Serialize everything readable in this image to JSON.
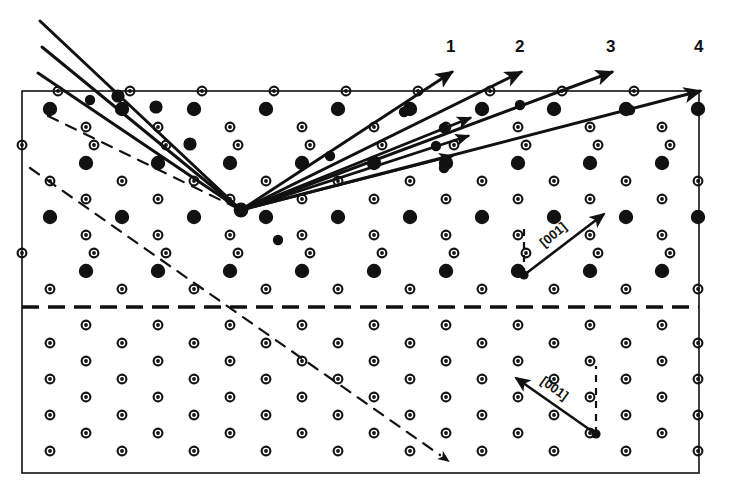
{
  "figure": {
    "kind": "crystallographic-lattice-diffraction-diagram",
    "background_color": "#ffffff",
    "ink_color": "#111111"
  },
  "frame": {
    "x": 22,
    "y": 91,
    "width": 677,
    "height": 382,
    "stroke_width": 1.6
  },
  "twin_boundary": {
    "label": "twin-boundary-dashed-line",
    "y": 307,
    "x_start": 22,
    "x_end": 699,
    "stroke_width": 3.4,
    "dash": "17 9"
  },
  "lattice": {
    "pitch_x": 72,
    "pitch_y": 36,
    "filled_radius": 7.2,
    "open_outer_radius": 4.4,
    "open_inner_radius": 1.9,
    "upper_region": {
      "note": "rows of large filled atoms alternating with rows of small open atoms, staggered",
      "rows": [
        {
          "y": 91,
          "type": "open",
          "x_start": 58,
          "count": 10
        },
        {
          "y": 109,
          "type": "filled",
          "x_start": 50,
          "count": 10
        },
        {
          "y": 127,
          "type": "open",
          "x_start": 86,
          "count": 9
        },
        {
          "y": 145,
          "type": "open",
          "x_start": 22,
          "count": 10
        },
        {
          "y": 163,
          "type": "filled",
          "x_start": 86,
          "count": 9
        },
        {
          "y": 181,
          "type": "open",
          "x_start": 50,
          "count": 10
        },
        {
          "y": 199,
          "type": "open",
          "x_start": 86,
          "count": 9
        },
        {
          "y": 217,
          "type": "filled",
          "x_start": 50,
          "count": 10
        },
        {
          "y": 235,
          "type": "open",
          "x_start": 86,
          "count": 9
        },
        {
          "y": 253,
          "type": "open",
          "x_start": 22,
          "count": 10
        },
        {
          "y": 271,
          "type": "filled",
          "x_start": 86,
          "count": 9
        },
        {
          "y": 289,
          "type": "open",
          "x_start": 50,
          "count": 10
        }
      ]
    },
    "lower_region": {
      "note": "mirrored twin: only small open atoms visible",
      "rows": [
        {
          "y": 325,
          "type": "open",
          "x_start": 86,
          "count": 9
        },
        {
          "y": 343,
          "type": "open",
          "x_start": 50,
          "count": 10
        },
        {
          "y": 361,
          "type": "open",
          "x_start": 86,
          "count": 9
        },
        {
          "y": 379,
          "type": "open",
          "x_start": 50,
          "count": 10
        },
        {
          "y": 397,
          "type": "open",
          "x_start": 86,
          "count": 9
        },
        {
          "y": 415,
          "type": "open",
          "x_start": 50,
          "count": 10
        },
        {
          "y": 433,
          "type": "open",
          "x_start": 86,
          "count": 9
        },
        {
          "y": 451,
          "type": "open",
          "x_start": 50,
          "count": 10
        }
      ]
    }
  },
  "scatter_point": {
    "x": 241,
    "y": 210,
    "label": "beam-convergence-point"
  },
  "incident_beams": [
    {
      "name": "incident-beam-a",
      "x1": 40,
      "y1": 21,
      "x2": 241,
      "y2": 210,
      "stroke_width": 3.0
    },
    {
      "name": "incident-beam-b",
      "x1": 42,
      "y1": 47,
      "x2": 241,
      "y2": 210,
      "stroke_width": 3.0
    },
    {
      "name": "incident-beam-c",
      "x1": 38,
      "y1": 73,
      "x2": 241,
      "y2": 210,
      "stroke_width": 3.0
    }
  ],
  "incident_stub_ends": [
    {
      "x": 118,
      "y": 96
    },
    {
      "x": 156,
      "y": 107
    },
    {
      "x": 190,
      "y": 144
    }
  ],
  "diffracted_beams": [
    {
      "name": "diffracted-beam-1",
      "label": "1",
      "x2": 452,
      "y2": 72,
      "label_x": 452,
      "label_y": 48,
      "stroke_width": 3.0
    },
    {
      "name": "diffracted-beam-2",
      "label": "2",
      "x2": 521,
      "y2": 72,
      "label_x": 521,
      "label_y": 48,
      "stroke_width": 3.0
    },
    {
      "name": "diffracted-beam-3",
      "label": "3",
      "x2": 612,
      "y2": 72,
      "label_x": 612,
      "label_y": 48,
      "stroke_width": 3.0
    },
    {
      "name": "diffracted-beam-4",
      "label": "4",
      "x2": 700,
      "y2": 91,
      "label_x": 700,
      "label_y": 48,
      "stroke_width": 3.0
    }
  ],
  "inner_fan_beams": [
    {
      "name": "fan-beam-inner-1",
      "x2": 470,
      "y2": 118
    },
    {
      "name": "fan-beam-inner-2",
      "x2": 468,
      "y2": 136
    },
    {
      "name": "fan-beam-inner-3",
      "x2": 452,
      "y2": 156
    }
  ],
  "beam_tick_markers": [
    {
      "x": 330,
      "y": 156
    },
    {
      "x": 404,
      "y": 112
    },
    {
      "x": 520,
      "y": 105
    },
    {
      "x": 444,
      "y": 128
    },
    {
      "x": 436,
      "y": 146
    },
    {
      "x": 444,
      "y": 168
    },
    {
      "x": 630,
      "y": 110
    },
    {
      "x": 278,
      "y": 240
    },
    {
      "x": 90,
      "y": 100
    }
  ],
  "dashed_twin_traces": [
    {
      "name": "dashed-trace-upper",
      "x1": 48,
      "y1": 116,
      "x2": 241,
      "y2": 210,
      "dash": "11 9",
      "stroke_width": 2.2
    },
    {
      "name": "dashed-trace-lower",
      "x1": 30,
      "y1": 168,
      "x2": 440,
      "y2": 455,
      "dash": "11 9",
      "stroke_width": 2.2
    }
  ],
  "dashed_trace_arrow": {
    "x": 440,
    "y": 455,
    "angle_deg": 35
  },
  "direction_markers": [
    {
      "name": "direction-marker-upper",
      "text": "[001]",
      "vertex_x": 524,
      "vertex_y": 275,
      "dash_top_x": 524,
      "dash_top_y": 223,
      "arrow_x": 604,
      "arrow_y": 214,
      "text_x": 556,
      "text_y": 238,
      "text_rotation_deg": -40,
      "font_size": 13
    },
    {
      "name": "direction-marker-lower",
      "text": "[001]",
      "vertex_x": 596,
      "vertex_y": 434,
      "dash_top_x": 596,
      "dash_top_y": 366,
      "arrow_x": 516,
      "arrow_y": 378,
      "text_x": 552,
      "text_y": 392,
      "text_rotation_deg": 36,
      "font_size": 13
    }
  ]
}
